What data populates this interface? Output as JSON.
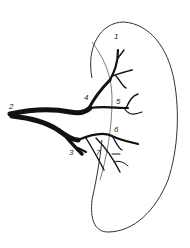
{
  "diagram": {
    "type": "anatomical vascular branching diagram",
    "colors": {
      "vessel": "#111111",
      "outline": "#333333",
      "background": "#ffffff"
    },
    "labels": [
      {
        "id": "1",
        "text": "1",
        "x": 114,
        "y": 39
      },
      {
        "id": "2",
        "text": "2",
        "x": 9,
        "y": 109
      },
      {
        "id": "3",
        "text": "3",
        "x": 69,
        "y": 155
      },
      {
        "id": "4",
        "text": "4",
        "x": 84,
        "y": 100
      },
      {
        "id": "5",
        "text": "5",
        "x": 116,
        "y": 104
      },
      {
        "id": "6",
        "text": "6",
        "x": 114,
        "y": 132
      },
      {
        "id": "7",
        "text": "7",
        "x": 96,
        "y": 155
      }
    ]
  }
}
